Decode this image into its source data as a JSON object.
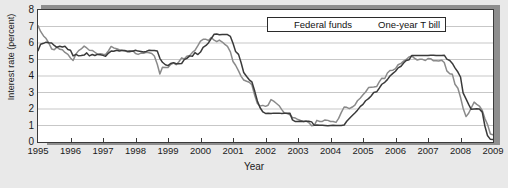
{
  "chart_data": {
    "type": "line",
    "title": "",
    "xlabel": "Year",
    "ylabel": "Interest rate (percent)",
    "xlim": [
      1995,
      2009
    ],
    "ylim": [
      0,
      8
    ],
    "ytick_labels": [
      "0",
      "1",
      "2",
      "3",
      "4",
      "5",
      "6",
      "7",
      "8"
    ],
    "ytick_values": [
      0,
      1,
      2,
      3,
      4,
      5,
      6,
      7,
      8
    ],
    "xtick_labels": [
      "1995",
      "1996",
      "1997",
      "1998",
      "1999",
      "2000",
      "2001",
      "2002",
      "2003",
      "2004",
      "2005",
      "2006",
      "2007",
      "2008",
      "2009"
    ],
    "xtick_values": [
      1995,
      1996,
      1997,
      1998,
      1999,
      2000,
      2001,
      2002,
      2003,
      2004,
      2005,
      2006,
      2007,
      2008,
      2009
    ],
    "grid": "horizontal",
    "legend_position": "top-right-inside",
    "series": [
      {
        "name": "Federal funds",
        "color": "#3a3a3a",
        "x": [
          1995.0,
          1995.08,
          1995.17,
          1995.25,
          1995.33,
          1995.42,
          1995.5,
          1995.58,
          1995.67,
          1995.75,
          1995.83,
          1995.92,
          1996.0,
          1996.08,
          1996.17,
          1996.25,
          1996.33,
          1996.42,
          1996.5,
          1996.58,
          1996.67,
          1996.75,
          1996.83,
          1996.92,
          1997.0,
          1997.08,
          1997.17,
          1997.25,
          1997.33,
          1997.42,
          1997.5,
          1997.58,
          1997.67,
          1997.75,
          1997.83,
          1997.92,
          1998.0,
          1998.08,
          1998.17,
          1998.25,
          1998.33,
          1998.42,
          1998.5,
          1998.58,
          1998.67,
          1998.75,
          1998.83,
          1998.92,
          1999.0,
          1999.08,
          1999.17,
          1999.25,
          1999.33,
          1999.42,
          1999.5,
          1999.58,
          1999.67,
          1999.75,
          1999.83,
          1999.92,
          2000.0,
          2000.08,
          2000.17,
          2000.25,
          2000.33,
          2000.42,
          2000.5,
          2000.58,
          2000.67,
          2000.75,
          2000.83,
          2000.92,
          2001.0,
          2001.08,
          2001.17,
          2001.25,
          2001.33,
          2001.42,
          2001.5,
          2001.58,
          2001.67,
          2001.75,
          2001.83,
          2001.92,
          2002.0,
          2002.08,
          2002.17,
          2002.25,
          2002.33,
          2002.42,
          2002.5,
          2002.58,
          2002.67,
          2002.75,
          2002.83,
          2002.92,
          2003.0,
          2003.08,
          2003.17,
          2003.25,
          2003.33,
          2003.42,
          2003.5,
          2003.58,
          2003.67,
          2003.75,
          2003.83,
          2003.92,
          2004.0,
          2004.08,
          2004.17,
          2004.25,
          2004.33,
          2004.42,
          2004.5,
          2004.58,
          2004.67,
          2004.75,
          2004.83,
          2004.92,
          2005.0,
          2005.08,
          2005.17,
          2005.25,
          2005.33,
          2005.42,
          2005.5,
          2005.58,
          2005.67,
          2005.75,
          2005.83,
          2005.92,
          2006.0,
          2006.08,
          2006.17,
          2006.25,
          2006.33,
          2006.42,
          2006.5,
          2006.58,
          2006.67,
          2006.75,
          2006.83,
          2006.92,
          2007.0,
          2007.08,
          2007.17,
          2007.25,
          2007.33,
          2007.42,
          2007.5,
          2007.58,
          2007.67,
          2007.75,
          2007.83,
          2007.92,
          2008.0,
          2008.08,
          2008.17,
          2008.25,
          2008.33,
          2008.42,
          2008.5,
          2008.58,
          2008.67,
          2008.75,
          2008.83,
          2008.92,
          2009.0
        ],
        "y": [
          5.53,
          5.92,
          5.98,
          6.05,
          6.01,
          6.0,
          5.85,
          5.74,
          5.8,
          5.76,
          5.8,
          5.6,
          5.56,
          5.22,
          5.31,
          5.22,
          5.24,
          5.27,
          5.4,
          5.22,
          5.3,
          5.24,
          5.31,
          5.29,
          5.25,
          5.19,
          5.39,
          5.51,
          5.5,
          5.56,
          5.52,
          5.54,
          5.54,
          5.5,
          5.52,
          5.5,
          5.56,
          5.51,
          5.49,
          5.45,
          5.49,
          5.56,
          5.54,
          5.55,
          5.51,
          5.07,
          4.83,
          4.68,
          4.63,
          4.76,
          4.81,
          4.74,
          4.74,
          4.76,
          4.99,
          5.07,
          5.22,
          5.2,
          5.42,
          5.3,
          5.45,
          5.73,
          5.85,
          6.02,
          6.27,
          6.53,
          6.54,
          6.5,
          6.52,
          6.51,
          6.51,
          6.4,
          5.98,
          5.49,
          5.31,
          4.8,
          4.21,
          3.97,
          3.77,
          3.65,
          3.07,
          2.49,
          2.09,
          1.82,
          1.73,
          1.74,
          1.73,
          1.75,
          1.75,
          1.75,
          1.73,
          1.74,
          1.75,
          1.75,
          1.34,
          1.24,
          1.24,
          1.26,
          1.25,
          1.26,
          1.26,
          1.22,
          1.01,
          1.03,
          1.01,
          1.01,
          1.0,
          0.98,
          1.0,
          1.01,
          1.0,
          1.0,
          1.0,
          1.03,
          1.26,
          1.43,
          1.61,
          1.76,
          1.93,
          2.16,
          2.28,
          2.5,
          2.63,
          2.79,
          3.0,
          3.04,
          3.26,
          3.5,
          3.62,
          3.78,
          4.0,
          4.16,
          4.29,
          4.49,
          4.59,
          4.79,
          4.94,
          4.99,
          5.24,
          5.25,
          5.25,
          5.25,
          5.25,
          5.24,
          5.25,
          5.26,
          5.26,
          5.25,
          5.25,
          5.25,
          5.26,
          5.02,
          4.94,
          4.76,
          4.49,
          4.24,
          3.94,
          2.98,
          2.61,
          2.28,
          1.98,
          2.0,
          2.01,
          2.0,
          1.81,
          0.97,
          0.39,
          0.16,
          0.15
        ],
        "peak_2000": 6.54,
        "trough_2003_2004": 1.0,
        "plateau_2006_2007": 5.25,
        "end_2009": 0.15
      },
      {
        "name": "One-year T bill",
        "color": "#8a8a8a",
        "x": [
          1995.0,
          1995.08,
          1995.17,
          1995.25,
          1995.33,
          1995.42,
          1995.5,
          1995.58,
          1995.67,
          1995.75,
          1995.83,
          1995.92,
          1996.0,
          1996.08,
          1996.17,
          1996.25,
          1996.33,
          1996.42,
          1996.5,
          1996.58,
          1996.67,
          1996.75,
          1996.83,
          1996.92,
          1997.0,
          1997.08,
          1997.17,
          1997.25,
          1997.33,
          1997.42,
          1997.5,
          1997.58,
          1997.67,
          1997.75,
          1997.83,
          1997.92,
          1998.0,
          1998.08,
          1998.17,
          1998.25,
          1998.33,
          1998.42,
          1998.5,
          1998.58,
          1998.67,
          1998.75,
          1998.83,
          1998.92,
          1999.0,
          1999.08,
          1999.17,
          1999.25,
          1999.33,
          1999.42,
          1999.5,
          1999.58,
          1999.67,
          1999.75,
          1999.83,
          1999.92,
          2000.0,
          2000.08,
          2000.17,
          2000.25,
          2000.33,
          2000.42,
          2000.5,
          2000.58,
          2000.67,
          2000.75,
          2000.83,
          2000.92,
          2001.0,
          2001.08,
          2001.17,
          2001.25,
          2001.33,
          2001.42,
          2001.5,
          2001.58,
          2001.67,
          2001.75,
          2001.83,
          2001.92,
          2002.0,
          2002.08,
          2002.17,
          2002.25,
          2002.33,
          2002.42,
          2002.5,
          2002.58,
          2002.67,
          2002.75,
          2002.83,
          2002.92,
          2003.0,
          2003.08,
          2003.17,
          2003.25,
          2003.33,
          2003.42,
          2003.5,
          2003.58,
          2003.67,
          2003.75,
          2003.83,
          2003.92,
          2004.0,
          2004.08,
          2004.17,
          2004.25,
          2004.33,
          2004.42,
          2004.5,
          2004.58,
          2004.67,
          2004.75,
          2004.83,
          2004.92,
          2005.0,
          2005.08,
          2005.17,
          2005.25,
          2005.33,
          2005.42,
          2005.5,
          2005.58,
          2005.67,
          2005.75,
          2005.83,
          2005.92,
          2006.0,
          2006.08,
          2006.17,
          2006.25,
          2006.33,
          2006.42,
          2006.5,
          2006.58,
          2006.67,
          2006.75,
          2006.83,
          2006.92,
          2007.0,
          2007.08,
          2007.17,
          2007.25,
          2007.33,
          2007.42,
          2007.5,
          2007.58,
          2007.67,
          2007.75,
          2007.83,
          2007.92,
          2008.0,
          2008.08,
          2008.17,
          2008.25,
          2008.33,
          2008.42,
          2008.5,
          2008.58,
          2008.67,
          2008.75,
          2008.83,
          2008.92,
          2009.0
        ],
        "y": [
          7.05,
          6.7,
          6.43,
          6.27,
          6.0,
          5.64,
          5.59,
          5.75,
          5.62,
          5.59,
          5.43,
          5.31,
          5.09,
          4.94,
          5.34,
          5.54,
          5.64,
          5.81,
          5.7,
          5.56,
          5.55,
          5.44,
          5.32,
          5.35,
          5.32,
          5.3,
          5.53,
          5.79,
          5.7,
          5.66,
          5.59,
          5.56,
          5.52,
          5.46,
          5.46,
          5.53,
          5.36,
          5.31,
          5.39,
          5.38,
          5.44,
          5.41,
          5.36,
          5.21,
          4.71,
          4.12,
          4.53,
          4.52,
          4.51,
          4.7,
          4.78,
          4.69,
          4.85,
          5.1,
          5.03,
          5.2,
          5.25,
          5.43,
          5.55,
          5.84,
          6.12,
          6.22,
          6.22,
          6.15,
          6.33,
          6.17,
          6.08,
          6.18,
          6.06,
          5.92,
          5.8,
          5.46,
          4.88,
          4.65,
          4.31,
          3.98,
          3.76,
          3.68,
          3.62,
          3.47,
          2.82,
          2.33,
          2.18,
          2.22,
          2.16,
          2.23,
          2.57,
          2.48,
          2.35,
          2.2,
          1.96,
          1.76,
          1.72,
          1.65,
          1.49,
          1.45,
          1.36,
          1.3,
          1.24,
          1.27,
          1.18,
          0.98,
          1.01,
          1.31,
          1.24,
          1.25,
          1.34,
          1.31,
          1.24,
          1.24,
          1.19,
          1.43,
          1.78,
          2.12,
          2.1,
          2.02,
          2.12,
          2.23,
          2.5,
          2.67,
          2.86,
          3.03,
          3.3,
          3.32,
          3.33,
          3.36,
          3.64,
          3.87,
          3.85,
          4.18,
          4.33,
          4.35,
          4.45,
          4.68,
          4.77,
          4.9,
          5.0,
          5.16,
          5.22,
          5.08,
          4.97,
          5.01,
          5.01,
          4.94,
          5.06,
          5.05,
          4.92,
          4.93,
          4.91,
          4.96,
          4.82,
          4.31,
          4.14,
          4.1,
          3.5,
          3.26,
          2.71,
          2.05,
          1.54,
          1.74,
          2.06,
          2.42,
          2.28,
          2.18,
          1.91,
          1.42,
          1.07,
          0.49,
          0.44
        ],
        "peak_2000": 6.33,
        "trough_2003_2004": 0.98,
        "plateau_2006_2007": 5.1,
        "end_2009": 0.44
      }
    ]
  },
  "legend": {
    "items": [
      {
        "label": "Federal funds",
        "color": "#3a3a3a"
      },
      {
        "label": "One-year T bill",
        "color": "#8a8a8a"
      }
    ]
  },
  "axes": {
    "x_title": "Year",
    "y_title": "Interest rate (percent)"
  }
}
